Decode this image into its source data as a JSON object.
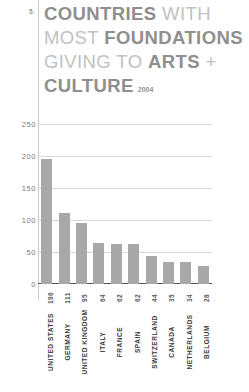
{
  "rank": "5.",
  "title": {
    "lines": [
      {
        "parts": [
          {
            "text": "COUNTRIES",
            "style": "bold"
          },
          {
            "text": " WITH",
            "style": "light"
          }
        ]
      },
      {
        "parts": [
          {
            "text": "MOST ",
            "style": "light"
          },
          {
            "text": "FOUNDATIONS",
            "style": "bold"
          }
        ]
      },
      {
        "parts": [
          {
            "text": "GIVING TO ",
            "style": "light"
          },
          {
            "text": "ARTS",
            "style": "bold"
          },
          {
            "text": " +",
            "style": "light"
          }
        ]
      },
      {
        "parts": [
          {
            "text": "CULTURE",
            "style": "bold"
          }
        ]
      }
    ],
    "line1_bold": "COUNTRIES",
    "line1_light": " WITH",
    "line2_light": "MOST ",
    "line2_bold": "FOUNDATIONS",
    "line3_light": "GIVING TO ",
    "line3_bold": "ARTS",
    "line3_tail": " +",
    "line4_bold": "CULTURE",
    "year": "2004"
  },
  "colors": {
    "bar": "#a8a8a8",
    "gridline": "#d8d8d8",
    "baseline": "#555555",
    "title_bold": "#8f8f8f",
    "title_light": "#c2c2c2",
    "label_dark": "#3a3a3a",
    "value_gray": "#5a5a5a",
    "rule": "#c9c9c9"
  },
  "chart_data": {
    "type": "bar",
    "title": "COUNTRIES WITH MOST FOUNDATIONS GIVING TO ARTS + CULTURE",
    "subtitle": "2004",
    "xlabel": "",
    "ylabel": "",
    "categories": [
      "UNITED STATES",
      "GERMANY",
      "UNITED KINGDOM",
      "ITALY",
      "FRANCE",
      "SPAIN",
      "SWITZERLAND",
      "CANADA",
      "NETHERLANDS",
      "BELGIUM"
    ],
    "values": [
      196,
      111,
      95,
      64,
      62,
      62,
      44,
      35,
      34,
      28
    ],
    "ylim": [
      0,
      250
    ],
    "yticks": [
      250,
      200,
      150,
      100,
      50,
      0
    ],
    "ytick_labels": [
      "250",
      "200",
      "150",
      "100",
      "50",
      "0"
    ],
    "grid": true,
    "legend": false,
    "orientation": "vertical"
  }
}
